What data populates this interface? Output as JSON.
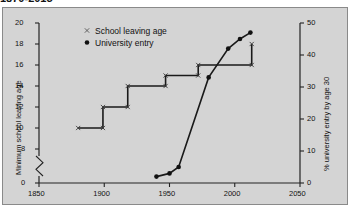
{
  "title": "1870-2015",
  "chart_data": {
    "type": "line",
    "title": "1870-2015",
    "xlabel": "",
    "xlim": [
      1850,
      2050
    ],
    "xticks": [
      1850,
      1900,
      1950,
      2000,
      2050
    ],
    "grid": false,
    "legend_position": "top-left",
    "axes": [
      {
        "id": "left",
        "ylabel": "Minimum school leaving age",
        "yticks": [
          0,
          8,
          10,
          12,
          14,
          16,
          18,
          20
        ],
        "ylim": [
          0,
          20
        ],
        "axis_break": true,
        "break_between": [
          0,
          8
        ]
      },
      {
        "id": "right",
        "ylabel": "% university entry by age 30",
        "yticks": [
          0,
          10,
          20,
          30,
          40,
          50
        ],
        "ylim": [
          0,
          50
        ],
        "axis_break": false
      }
    ],
    "series": [
      {
        "name": "School leaving age",
        "axis": "left",
        "marker": "x",
        "drawstyle": "steps-post",
        "units": "years of age",
        "points": [
          {
            "x": 1880,
            "y": 10
          },
          {
            "x": 1899,
            "y": 10
          },
          {
            "x": 1899,
            "y": 12
          },
          {
            "x": 1918,
            "y": 12
          },
          {
            "x": 1918,
            "y": 14
          },
          {
            "x": 1947,
            "y": 14
          },
          {
            "x": 1947,
            "y": 15
          },
          {
            "x": 1972,
            "y": 15
          },
          {
            "x": 1972,
            "y": 16
          },
          {
            "x": 2013,
            "y": 16
          },
          {
            "x": 2013,
            "y": 18
          }
        ]
      },
      {
        "name": "University entry",
        "axis": "right",
        "marker": "o",
        "drawstyle": "line",
        "units": "percent",
        "points": [
          {
            "x": 1940,
            "y": 2
          },
          {
            "x": 1950,
            "y": 3
          },
          {
            "x": 1957,
            "y": 5
          },
          {
            "x": 1980,
            "y": 33
          },
          {
            "x": 1995,
            "y": 42
          },
          {
            "x": 2004,
            "y": 45
          },
          {
            "x": 2012,
            "y": 47
          }
        ]
      }
    ],
    "legend": [
      {
        "label": "School leaving age",
        "marker": "x"
      },
      {
        "label": "University entry",
        "marker": "dot"
      }
    ]
  }
}
